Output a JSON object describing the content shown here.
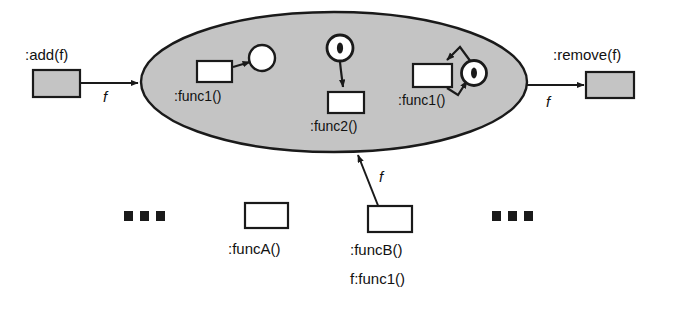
{
  "diagram": {
    "colors": {
      "fill_gray": "#c4c4c4",
      "fill_white": "#ffffff",
      "stroke": "#1a1a1a",
      "background": "#ffffff"
    },
    "container": {
      "name": "collection-ellipse",
      "shape": "ellipse",
      "fill": "#c4c4c4"
    },
    "nodes": [
      {
        "id": "add",
        "label": ":add(f)",
        "shape": "rect",
        "fill": "#c4c4c4"
      },
      {
        "id": "remove",
        "label": ":remove(f)",
        "shape": "rect",
        "fill": "#c4c4c4"
      },
      {
        "id": "func1_a",
        "label": ":func1()",
        "shape": "rect",
        "fill": "#ffffff"
      },
      {
        "id": "func2",
        "label": ":func2()",
        "shape": "rect",
        "fill": "#ffffff"
      },
      {
        "id": "func1_b",
        "label": ":func1()",
        "shape": "rect",
        "fill": "#ffffff"
      },
      {
        "id": "funcA",
        "label": ":funcA()",
        "shape": "rect",
        "fill": "#ffffff"
      },
      {
        "id": "funcB",
        "label": ":funcB()",
        "label2": "f:func1()",
        "shape": "rect",
        "fill": "#ffffff"
      }
    ],
    "circles": [
      {
        "id": "circle_plain",
        "token": false
      },
      {
        "id": "circle_token_mid",
        "token": true
      },
      {
        "id": "circle_token_right",
        "token": true
      }
    ],
    "edges": [
      {
        "id": "add-to-ellipse",
        "label": "f",
        "arrows": "end"
      },
      {
        "id": "ellipse-to-remove",
        "label": "f",
        "arrows": "end"
      },
      {
        "id": "funcB-to-ellipse",
        "label": "f",
        "arrows": "both"
      },
      {
        "id": "func1a-to-circle",
        "label": "",
        "arrows": "end"
      },
      {
        "id": "circle-to-func2",
        "label": "",
        "arrows": "end"
      },
      {
        "id": "circle-to-func1b",
        "label": "",
        "arrows": "end"
      },
      {
        "id": "func1b-to-circle",
        "label": "",
        "arrows": "end"
      }
    ],
    "ellipsis": {
      "left": "...",
      "right": "..."
    }
  }
}
